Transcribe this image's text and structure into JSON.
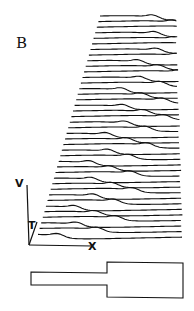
{
  "panel_label": "B",
  "axes": {
    "v_label": "V",
    "t_label": "T",
    "x_label": "X"
  },
  "chart_data": {
    "type": "line",
    "title": "",
    "n_traces": 40,
    "xlabel": "X",
    "ylabel": "V",
    "zlabel": "T",
    "geometry_schematic": "narrow cable joined to wider cable (step increase in diameter)"
  },
  "colors": {
    "ink": "#111111",
    "background": "#ffffff"
  }
}
